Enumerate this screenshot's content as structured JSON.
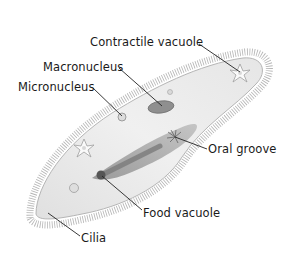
{
  "diagram": {
    "labels": [
      {
        "id": "contractile-vacuole",
        "text": "Contractile vacuole",
        "x": 90,
        "y": 36,
        "line": [
          199,
          44,
          240,
          72
        ]
      },
      {
        "id": "macronucleus",
        "text": "Macronucleus",
        "x": 43,
        "y": 61,
        "line": [
          119,
          68,
          162,
          106
        ]
      },
      {
        "id": "micronucleus",
        "text": "Micronucleus",
        "x": 18,
        "y": 81,
        "line": [
          93,
          88,
          122,
          116
        ]
      },
      {
        "id": "oral-groove",
        "text": "Oral groove",
        "x": 208,
        "y": 143,
        "line": [
          207,
          149,
          175,
          137
        ]
      },
      {
        "id": "food-vacuole",
        "text": "Food vacuole",
        "x": 143,
        "y": 207,
        "line": [
          142,
          210,
          102,
          176
        ]
      },
      {
        "id": "cilia",
        "text": "Cilia",
        "x": 81,
        "y": 232,
        "line": [
          80,
          236,
          48,
          213
        ]
      }
    ],
    "colors": {
      "background": "#ffffff",
      "body_fill": "#ebebeb",
      "body_shade": "#c9c9c9",
      "groove": "#9a9a9a",
      "cilia": "#8a8a8a",
      "leader": "#222222",
      "text": "#1a1a1a"
    }
  }
}
